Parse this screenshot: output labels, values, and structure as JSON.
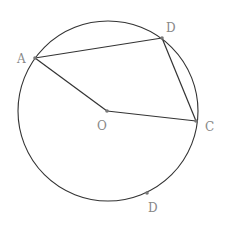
{
  "diagram": {
    "type": "geometry-circle",
    "circle": {
      "cx": 108,
      "cy": 111,
      "r": 90,
      "stroke": "#333333"
    },
    "points": {
      "A": {
        "label": "A",
        "x": 35,
        "y": 58,
        "lx": 18,
        "ly": 62
      },
      "D1": {
        "label": "D",
        "x": 162,
        "y": 38,
        "lx": 167,
        "ly": 31
      },
      "O": {
        "label": "O",
        "x": 107,
        "y": 111,
        "lx": 98,
        "ly": 129
      },
      "C": {
        "label": "C",
        "x": 196,
        "y": 121,
        "lx": 206,
        "ly": 130
      },
      "D2": {
        "label": "D",
        "x": 147,
        "y": 193,
        "lx": 149,
        "ly": 211
      }
    },
    "segments": [
      [
        "A",
        "D1"
      ],
      [
        "D1",
        "C"
      ],
      [
        "A",
        "O"
      ],
      [
        "O",
        "C"
      ]
    ],
    "label_color": "#888888",
    "point_color": "#777777"
  }
}
